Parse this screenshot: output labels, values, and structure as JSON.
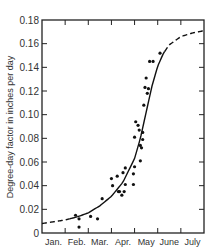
{
  "chart_data": {
    "type": "scatter",
    "title": "",
    "xlabel": "",
    "ylabel": "Degree-day factor in inches per day",
    "x_categories": [
      "Jan.",
      "Feb.",
      "Mar.",
      "Apr.",
      "May",
      "June",
      "July"
    ],
    "ylim": [
      0,
      0.18
    ],
    "y_ticks": [
      "0",
      "0.02",
      "0.04",
      "0.06",
      "0.08",
      "0.10",
      "0.12",
      "0.14",
      "0.16",
      "0.18"
    ],
    "grid": false,
    "legend": null,
    "x_units": "months since Jan 1 (0 = start of Jan, 7 = end of July)",
    "series": [
      {
        "name": "observed",
        "kind": "points",
        "x": [
          1.45,
          1.6,
          1.6,
          2.1,
          2.4,
          2.6,
          3.0,
          3.05,
          3.25,
          3.3,
          3.35,
          3.45,
          3.5,
          3.55,
          3.6,
          3.6,
          3.95,
          3.95,
          4.0,
          4.0,
          4.05,
          4.15,
          4.2,
          4.25,
          4.25,
          4.3,
          4.35,
          4.35,
          4.4,
          4.45,
          4.5,
          4.55,
          4.6,
          4.65,
          4.8,
          5.1
        ],
        "y": [
          0.015,
          0.005,
          0.012,
          0.014,
          0.012,
          0.029,
          0.046,
          0.04,
          0.048,
          0.035,
          0.035,
          0.032,
          0.051,
          0.035,
          0.041,
          0.055,
          0.041,
          0.05,
          0.056,
          0.081,
          0.094,
          0.091,
          0.087,
          0.074,
          0.061,
          0.072,
          0.085,
          0.079,
          0.108,
          0.123,
          0.131,
          0.118,
          0.122,
          0.145,
          0.145,
          0.152
        ]
      },
      {
        "name": "fitted curve",
        "kind": "line",
        "x": [
          0,
          0.5,
          1.0,
          1.5,
          2.0,
          2.5,
          3.0,
          3.5,
          4.0,
          4.25,
          4.5,
          4.75,
          5.0,
          5.25,
          5.5,
          6.0,
          6.5,
          7.0
        ],
        "y": [
          0.008,
          0.0095,
          0.011,
          0.0135,
          0.017,
          0.023,
          0.031,
          0.043,
          0.063,
          0.08,
          0.102,
          0.124,
          0.141,
          0.152,
          0.159,
          0.166,
          0.169,
          0.171
        ]
      }
    ],
    "line_styles": {
      "dashed_segments_x": [
        [
          0,
          1.2
        ],
        [
          5.3,
          7.0
        ]
      ],
      "solid_segment_x": [
        1.2,
        5.3
      ]
    }
  }
}
